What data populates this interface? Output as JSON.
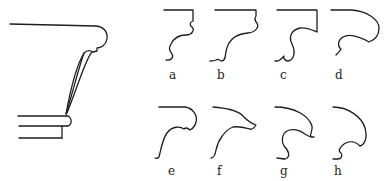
{
  "figure": {
    "main_profile": {
      "name": "capital-profile"
    },
    "profiles": [
      {
        "id": "a",
        "label": "a"
      },
      {
        "id": "b",
        "label": "b"
      },
      {
        "id": "c",
        "label": "c"
      },
      {
        "id": "d",
        "label": "d"
      },
      {
        "id": "e",
        "label": "e"
      },
      {
        "id": "f",
        "label": "f"
      },
      {
        "id": "g",
        "label": "g"
      },
      {
        "id": "h",
        "label": "h"
      }
    ],
    "colors": {
      "line": "#1e1e1e",
      "background": "#ffffff"
    }
  }
}
